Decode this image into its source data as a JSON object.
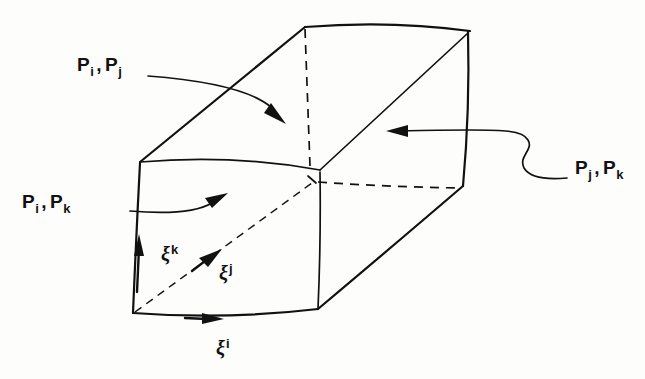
{
  "figure": {
    "background_color": "#fdfdfc",
    "ink_color": "#111111"
  },
  "labels": {
    "face_ij": {
      "base1": "P",
      "sub1": "i",
      "comma": ",",
      "base2": "P",
      "sub2": "j"
    },
    "face_ik": {
      "base1": "P",
      "sub1": "i",
      "comma": ",",
      "base2": "P",
      "sub2": "k"
    },
    "face_jk": {
      "base1": "P",
      "sub1": "j",
      "comma": ",",
      "base2": "P",
      "sub2": "k"
    }
  },
  "axes": [
    {
      "name": "xi-k",
      "symbol": "ξ",
      "superscript": "k",
      "direction": "up",
      "label_x": 161,
      "label_y": 243
    },
    {
      "name": "xi-j",
      "symbol": "ξ",
      "superscript": "j",
      "direction": "up-right-dashed",
      "label_x": 219,
      "label_y": 262
    },
    {
      "name": "xi-i",
      "symbol": "ξ",
      "superscript": "i",
      "direction": "right",
      "label_x": 216,
      "label_y": 337
    }
  ],
  "geometry": {
    "vertices": {
      "top_back_left": [
        305,
        27
      ],
      "top_back_right": [
        470,
        31
      ],
      "top_front_left": [
        140,
        162
      ],
      "top_front_center": [
        320,
        170
      ],
      "right_upper": [
        467,
        31
      ],
      "right_lower": [
        463,
        185
      ],
      "bottom_front_left": [
        133,
        313
      ],
      "bottom_front_right": [
        318,
        309
      ],
      "hidden_back_bottom_right": [
        460,
        188
      ]
    }
  },
  "colors": {
    "ink": "#111111",
    "paper": "#fdfdfc"
  }
}
